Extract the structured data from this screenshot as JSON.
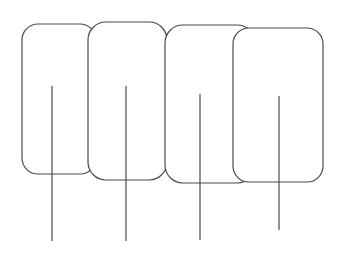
{
  "canvas": {
    "width": 341,
    "height": 260,
    "background": "#ffffff"
  },
  "style": {
    "stroke": "#4a4a4a",
    "stroke_width": 1.2,
    "card_fill": "#ffffff"
  },
  "shapes": [
    {
      "id": "card-1",
      "x": 22,
      "y": 24,
      "w": 74,
      "h": 150,
      "r": 16,
      "stick_x": 52,
      "stick_y1": 86,
      "stick_y2": 241
    },
    {
      "id": "card-2",
      "x": 88,
      "y": 22,
      "w": 79,
      "h": 158,
      "r": 18,
      "stick_x": 126,
      "stick_y1": 86,
      "stick_y2": 241
    },
    {
      "id": "card-3",
      "x": 165,
      "y": 25,
      "w": 90,
      "h": 158,
      "r": 18,
      "stick_x": 200,
      "stick_y1": 94,
      "stick_y2": 240
    },
    {
      "id": "card-4",
      "x": 233,
      "y": 28,
      "w": 90,
      "h": 154,
      "r": 16,
      "stick_x": 279,
      "stick_y1": 96,
      "stick_y2": 230
    }
  ]
}
